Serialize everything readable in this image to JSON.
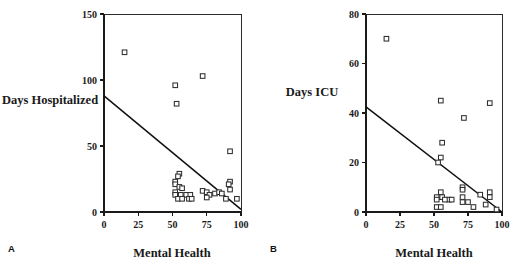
{
  "figure": {
    "panel_a_label": "A",
    "panel_b_label": "B",
    "marker_color": "#2e2e2e",
    "line_color": "#101010"
  },
  "chart_data": [
    {
      "type": "scatter",
      "panel": "A",
      "title": "",
      "xlabel": "Mental Health",
      "ylabel": "Days  Hospitalized",
      "xlim": [
        0,
        100
      ],
      "ylim": [
        0,
        150
      ],
      "xticks": [
        0,
        25,
        50,
        75,
        100
      ],
      "yticks": [
        0,
        50,
        100,
        150
      ],
      "xticklabels": [
        "0",
        "25",
        "50",
        "75",
        "100"
      ],
      "yticklabels": [
        "0",
        "50",
        "100",
        "150"
      ],
      "grid": false,
      "legend": false,
      "points": [
        {
          "x": 15,
          "y": 121
        },
        {
          "x": 52,
          "y": 96
        },
        {
          "x": 72,
          "y": 103
        },
        {
          "x": 53,
          "y": 82
        },
        {
          "x": 92,
          "y": 46
        },
        {
          "x": 55,
          "y": 29
        },
        {
          "x": 54,
          "y": 27
        },
        {
          "x": 52,
          "y": 23
        },
        {
          "x": 52,
          "y": 21
        },
        {
          "x": 92,
          "y": 23
        },
        {
          "x": 91,
          "y": 21
        },
        {
          "x": 55,
          "y": 19
        },
        {
          "x": 57,
          "y": 18
        },
        {
          "x": 92,
          "y": 17
        },
        {
          "x": 52,
          "y": 15
        },
        {
          "x": 52,
          "y": 13
        },
        {
          "x": 56,
          "y": 13
        },
        {
          "x": 60,
          "y": 13
        },
        {
          "x": 63,
          "y": 13
        },
        {
          "x": 72,
          "y": 16
        },
        {
          "x": 75,
          "y": 15
        },
        {
          "x": 77,
          "y": 13
        },
        {
          "x": 81,
          "y": 14
        },
        {
          "x": 84,
          "y": 15
        },
        {
          "x": 86,
          "y": 14
        },
        {
          "x": 54,
          "y": 10
        },
        {
          "x": 57,
          "y": 10
        },
        {
          "x": 62,
          "y": 10
        },
        {
          "x": 64,
          "y": 10
        },
        {
          "x": 75,
          "y": 11
        },
        {
          "x": 89,
          "y": 10
        },
        {
          "x": 97,
          "y": 10
        }
      ],
      "fit_line": {
        "x0": 0,
        "y0": 88,
        "x1": 100,
        "y1": 2
      }
    },
    {
      "type": "scatter",
      "panel": "B",
      "title": "",
      "xlabel": "Mental Health",
      "ylabel": "Days  ICU",
      "xlim": [
        0,
        100
      ],
      "ylim": [
        0,
        80
      ],
      "xticks": [
        0,
        25,
        50,
        75,
        100
      ],
      "yticks": [
        0,
        20,
        40,
        60,
        80
      ],
      "xticklabels": [
        "0",
        "25",
        "50",
        "75",
        "100"
      ],
      "yticklabels": [
        "0",
        "20",
        "40",
        "60",
        "80"
      ],
      "grid": false,
      "legend": false,
      "points": [
        {
          "x": 15,
          "y": 70
        },
        {
          "x": 55,
          "y": 45
        },
        {
          "x": 91,
          "y": 44
        },
        {
          "x": 72,
          "y": 38
        },
        {
          "x": 56,
          "y": 28
        },
        {
          "x": 55,
          "y": 22
        },
        {
          "x": 53,
          "y": 20
        },
        {
          "x": 71,
          "y": 10
        },
        {
          "x": 71,
          "y": 9
        },
        {
          "x": 55,
          "y": 8
        },
        {
          "x": 91,
          "y": 8
        },
        {
          "x": 84,
          "y": 7
        },
        {
          "x": 52,
          "y": 6
        },
        {
          "x": 56,
          "y": 6
        },
        {
          "x": 61,
          "y": 5
        },
        {
          "x": 63,
          "y": 5
        },
        {
          "x": 71,
          "y": 6
        },
        {
          "x": 91,
          "y": 6
        },
        {
          "x": 52,
          "y": 5
        },
        {
          "x": 58,
          "y": 5
        },
        {
          "x": 71,
          "y": 4
        },
        {
          "x": 75,
          "y": 4
        },
        {
          "x": 52,
          "y": 2
        },
        {
          "x": 55,
          "y": 2
        },
        {
          "x": 79,
          "y": 2
        },
        {
          "x": 88,
          "y": 3
        },
        {
          "x": 96,
          "y": 1
        }
      ],
      "fit_line": {
        "x0": 0,
        "y0": 42.5,
        "x1": 100,
        "y1": 0
      }
    }
  ]
}
